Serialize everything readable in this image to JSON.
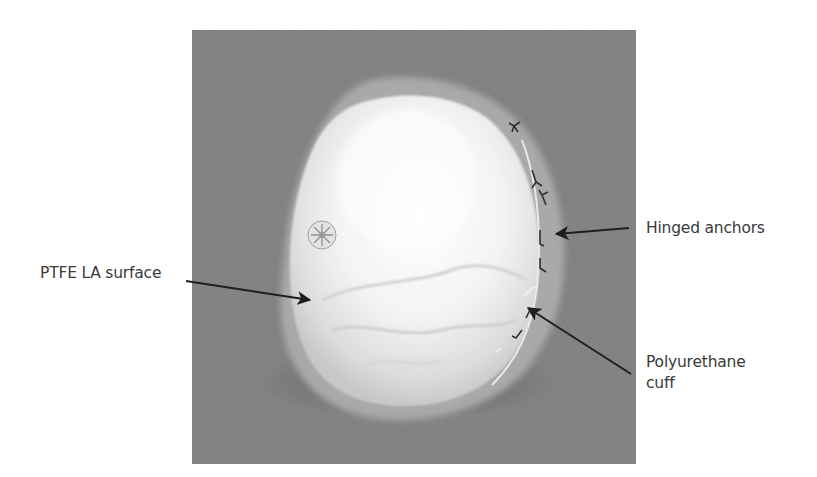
{
  "figure": {
    "photo_background_color": "#7d7d7d",
    "device_color": "#f2f2f2",
    "labels": [
      {
        "id": "ptfe",
        "text": "PTFE LA surface"
      },
      {
        "id": "hinged",
        "text": "Hinged anchors"
      },
      {
        "id": "cuff",
        "line1": "Polyurethane",
        "line2": "cuff"
      }
    ],
    "arrow_color": "#1e1e1e",
    "label_color": "#3a3a3a"
  }
}
